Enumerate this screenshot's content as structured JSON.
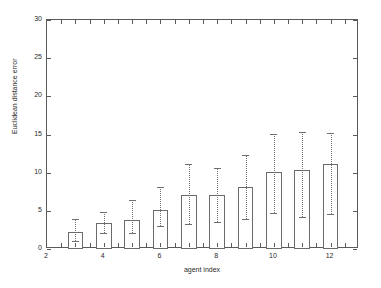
{
  "chart_data": {
    "type": "bar",
    "title": "",
    "xlabel": "agent index",
    "ylabel": "Euclidean distance error",
    "xlim": [
      2,
      13
    ],
    "ylim": [
      0,
      30
    ],
    "ytick_values": [
      0,
      5,
      10,
      15,
      20,
      25,
      30
    ],
    "ytick_labels": [
      "0",
      "5",
      "10",
      "15",
      "20",
      "25",
      "30"
    ],
    "xtick_values": [
      2,
      4,
      6,
      8,
      10,
      12
    ],
    "xtick_labels": [
      "2",
      "4",
      "6",
      "8",
      "10",
      "12"
    ],
    "xtick_minor_step": 0.5,
    "grid": false,
    "legend": null,
    "bar_width": 0.55,
    "bar_fill_color": "#ffffff",
    "bar_edge_color": "#6b6b6b",
    "errorbar_color": "#6f6f6f",
    "errorbar_style": "dotted",
    "categories": [
      3,
      4,
      5,
      6,
      7,
      8,
      9,
      10,
      11,
      12
    ],
    "values": [
      2.2,
      3.4,
      3.8,
      5.1,
      7.1,
      7.1,
      8.1,
      10.1,
      10.4,
      11.2
    ],
    "error_low": [
      1.0,
      2.1,
      2.1,
      3.0,
      3.3,
      3.5,
      3.9,
      4.7,
      4.2,
      5.0
    ],
    "error_high": [
      3.9,
      4.8,
      6.4,
      8.1,
      11.2,
      10.6,
      12.3,
      15.1,
      15.3,
      15.2
    ],
    "series": [
      {
        "name": "Euclidean distance error",
        "points": [
          {
            "x": 3,
            "value": 2.2,
            "low": 1.0,
            "high": 3.9
          },
          {
            "x": 4,
            "value": 3.4,
            "low": 2.1,
            "high": 4.8
          },
          {
            "x": 5,
            "value": 3.8,
            "low": 2.1,
            "high": 6.4
          },
          {
            "x": 6,
            "value": 5.1,
            "low": 3.0,
            "high": 8.1
          },
          {
            "x": 7,
            "value": 7.1,
            "low": 3.3,
            "high": 11.2
          },
          {
            "x": 8,
            "value": 7.1,
            "low": 3.5,
            "high": 10.6
          },
          {
            "x": 9,
            "value": 8.1,
            "low": 3.9,
            "high": 12.3
          },
          {
            "x": 10,
            "value": 10.1,
            "low": 4.7,
            "high": 15.1
          },
          {
            "x": 11,
            "value": 10.4,
            "low": 4.2,
            "high": 15.3
          },
          {
            "x": 12,
            "value": 11.2,
            "low": 4.6,
            "high": 15.2
          }
        ]
      }
    ]
  }
}
